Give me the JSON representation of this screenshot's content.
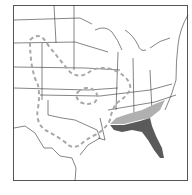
{
  "map": {
    "region": "Eastern United States",
    "legend": [],
    "colors": {
      "border": "#555555",
      "state_lines": "#333333",
      "range_dark": "#5a5a5a",
      "range_light": "#b0b0b0",
      "dashed_outline": "#a8a8a8",
      "background": "#ffffff"
    },
    "features": [
      {
        "name": "dark-shaded-range",
        "description": "Florida and Gulf coast"
      },
      {
        "name": "light-shaded-range",
        "description": "Southern Georgia, South Carolina coast"
      },
      {
        "name": "dashed-range-outline",
        "description": "Great Plains to Texas and Midwest loop"
      }
    ]
  }
}
